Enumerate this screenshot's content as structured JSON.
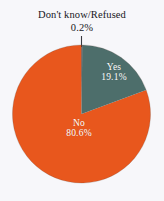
{
  "chart_data": {
    "type": "pie",
    "title": "",
    "categories": [
      "Yes",
      "No",
      "Don't know/Refused"
    ],
    "values": [
      19.1,
      80.6,
      0.2
    ],
    "value_labels": [
      "19.1%",
      "80.6%",
      "0.2%"
    ],
    "units": "percent",
    "colors": [
      "#4d6e6b",
      "#e8571d",
      "#2b2b30"
    ],
    "legend": "none",
    "grid": false,
    "start_angle_deg": 0,
    "direction": "clockwise",
    "annotations": [
      {
        "name": "Don't know/Refused",
        "value_label": "0.2%",
        "placement": "callout-above-pie",
        "leader_line": true
      }
    ]
  },
  "callout": {
    "title": "Don't know/Refused",
    "value": "0.2%"
  },
  "slices": {
    "yes": {
      "name": "Yes",
      "value": "19.1%",
      "color": "#4d6e6b"
    },
    "no": {
      "name": "No",
      "value": "80.6%",
      "color": "#e8571d"
    },
    "dont_know": {
      "name": "Don't know/Refused",
      "value": "0.2%",
      "color": "#2b2b30"
    }
  },
  "geometry": {
    "center_x": 81.5,
    "center_y": 114,
    "radius": 69
  },
  "background_color": "#f7f7fa"
}
